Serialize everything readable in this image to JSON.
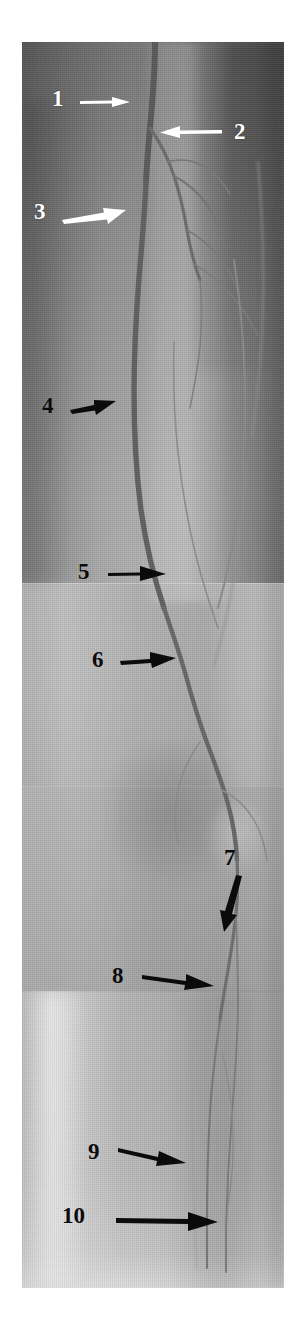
{
  "figure": {
    "kind": "digital-subtraction-angiogram",
    "modality_label": "DSA",
    "region": "lower-limb-runoff",
    "panel_count": 4,
    "background_color": "#ffffff",
    "image_tone": "#8d8d8d"
  },
  "annotations": [
    {
      "id": "1",
      "label": "1",
      "color": "#ffffff",
      "arrow": "right",
      "arrow_length": 46,
      "num_x": 52,
      "num_y": 56,
      "arrow_x": 78,
      "arrow_y": 66,
      "tip_x": 128,
      "tip_y": 62
    },
    {
      "id": "2",
      "label": "2",
      "color": "#ffffff",
      "arrow": "left",
      "arrow_length": 52,
      "num_x": 234,
      "num_y": 86,
      "arrow_x": 160,
      "arrow_y": 100,
      "tip_x": 152,
      "tip_y": 98
    },
    {
      "id": "3",
      "label": "3",
      "color": "#ffffff",
      "arrow": "right",
      "arrow_length": 58,
      "num_x": 34,
      "num_y": 168,
      "arrow_x": 64,
      "arrow_y": 184,
      "tip_x": 128,
      "tip_y": 190
    },
    {
      "id": "4",
      "label": "4",
      "color": "#0b0b0b",
      "arrow": "right",
      "arrow_length": 38,
      "num_x": 42,
      "num_y": 392,
      "arrow_x": 70,
      "arrow_y": 402,
      "tip_x": 112,
      "tip_y": 400
    },
    {
      "id": "5",
      "label": "5",
      "color": "#0b0b0b",
      "arrow": "right",
      "arrow_length": 54,
      "num_x": 78,
      "num_y": 558,
      "arrow_x": 104,
      "arrow_y": 572,
      "tip_x": 160,
      "tip_y": 570
    },
    {
      "id": "6",
      "label": "6",
      "color": "#0b0b0b",
      "arrow": "right",
      "arrow_length": 54,
      "num_x": 92,
      "num_y": 646,
      "arrow_x": 118,
      "arrow_y": 660,
      "tip_x": 172,
      "tip_y": 656
    },
    {
      "id": "7",
      "label": "7",
      "color": "#0b0b0b",
      "arrow": "down",
      "arrow_length": 56,
      "num_x": 226,
      "num_y": 846,
      "arrow_x": 232,
      "arrow_y": 876,
      "tip_x": 214,
      "tip_y": 934
    },
    {
      "id": "8",
      "label": "8",
      "color": "#0b0b0b",
      "arrow": "right",
      "arrow_length": 70,
      "num_x": 112,
      "num_y": 962,
      "arrow_x": 142,
      "arrow_y": 978,
      "tip_x": 212,
      "tip_y": 988
    },
    {
      "id": "9",
      "label": "9",
      "color": "#0b0b0b",
      "arrow": "right",
      "arrow_length": 66,
      "num_x": 88,
      "num_y": 1142,
      "arrow_x": 118,
      "arrow_y": 1154,
      "tip_x": 186,
      "tip_y": 1170
    },
    {
      "id": "10",
      "label": "10",
      "color": "#0b0b0b",
      "arrow": "right",
      "arrow_length": 98,
      "num_x": 72,
      "num_y": 1206,
      "arrow_x": 118,
      "arrow_y": 1222,
      "tip_x": 216,
      "tip_y": 1222
    }
  ],
  "panels": [
    {
      "name": "pelvis-upper-thigh",
      "top": 0,
      "height": 542,
      "tone": "dark"
    },
    {
      "name": "mid-thigh",
      "top": 541,
      "height": 203,
      "tone": "light"
    },
    {
      "name": "knee",
      "top": 744,
      "height": 206,
      "tone": "mid"
    },
    {
      "name": "calf",
      "top": 949,
      "height": 297,
      "tone": "bright"
    }
  ],
  "vessels": [
    {
      "name": "common-femoral-artery",
      "stroke": "#5c5c5c",
      "width": 5.5
    },
    {
      "name": "superficial-femoral-artery",
      "stroke": "#5f5f5f",
      "width": 5.0
    },
    {
      "name": "profunda-femoris-artery",
      "stroke": "#6e6e6e",
      "width": 3.0
    },
    {
      "name": "popliteal-artery",
      "stroke": "#6a6a6a",
      "width": 4.0
    },
    {
      "name": "anterior-tibial-artery",
      "stroke": "#7a7a7a",
      "width": 2.0
    },
    {
      "name": "posterior-tibial-artery",
      "stroke": "#7d7d7d",
      "width": 1.8
    },
    {
      "name": "collateral-branches",
      "stroke": "#7f7f7f",
      "width": 1.4
    }
  ]
}
